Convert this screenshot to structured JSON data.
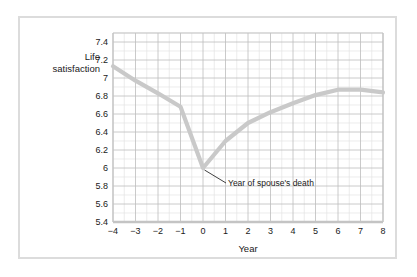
{
  "chart_data": {
    "type": "line",
    "title": "",
    "xlabel": "Year",
    "ylabel": "Life satisfaction",
    "ylabel_line1": "Life",
    "ylabel_line2": "satisfaction",
    "xlim": [
      -4,
      8
    ],
    "ylim": [
      5.4,
      7.5
    ],
    "grid": true,
    "grid_major_y_step": 0.2,
    "grid_minor_y_step": 0.1,
    "grid_major_x_step": 1,
    "grid_minor_x_step": 0.5,
    "legend": "none",
    "x_tick_labels": [
      "−4",
      "−3",
      "−2",
      "−1",
      "0",
      "1",
      "2",
      "3",
      "4",
      "5",
      "6",
      "7",
      "8"
    ],
    "x_tick_values": [
      -4,
      -3,
      -2,
      -1,
      0,
      1,
      2,
      3,
      4,
      5,
      6,
      7,
      8
    ],
    "y_tick_labels": [
      "5.4",
      "5.6",
      "5.8",
      "6",
      "6.2",
      "6.4",
      "6.6",
      "6.8",
      "7",
      "7.2",
      "7.4"
    ],
    "y_tick_values": [
      5.4,
      5.6,
      5.8,
      6.0,
      6.2,
      6.4,
      6.6,
      6.8,
      7.0,
      7.2,
      7.4
    ],
    "x": [
      -4,
      -3,
      -2,
      -1,
      0,
      1,
      2,
      3,
      4,
      5,
      6,
      7,
      8
    ],
    "values": [
      7.13,
      6.97,
      6.83,
      6.68,
      6.0,
      6.3,
      6.5,
      6.62,
      6.72,
      6.81,
      6.87,
      6.87,
      6.84
    ],
    "series": [
      {
        "name": "Life satisfaction",
        "color": "#c9c9c9",
        "values": [
          7.13,
          6.97,
          6.83,
          6.68,
          6.0,
          6.3,
          6.5,
          6.62,
          6.72,
          6.81,
          6.87,
          6.87,
          6.84
        ]
      }
    ],
    "annotations": [
      {
        "text": "Year of spouse's death",
        "point_x": 0,
        "point_y": 6.0,
        "label_x": 2.05,
        "label_y": 5.82
      }
    ],
    "colors": {
      "line": "#c9c9c9",
      "grid_major": "#bdbdbd",
      "grid_minor": "#e4e4e4",
      "plot_border": "#c4c4c4",
      "frame_border": "#dcdcdc",
      "text": "#1a1a1a",
      "annotation_leader": "#2b2b2b",
      "background": "#ffffff"
    }
  }
}
